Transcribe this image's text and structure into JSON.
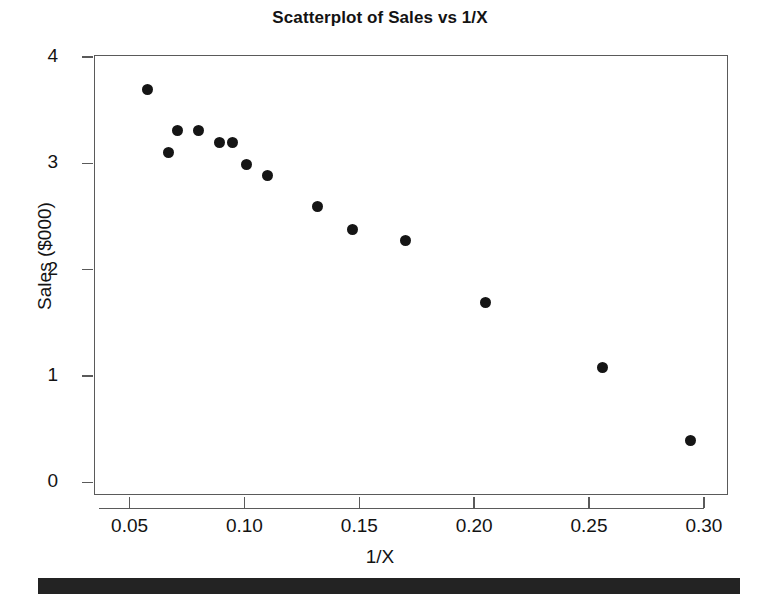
{
  "chart_data": {
    "type": "scatter",
    "title": "Scatterplot of Sales vs 1/X",
    "xlabel": "1/X",
    "ylabel": "Sales ($000)",
    "xlim": [
      0.0345,
      0.3105
    ],
    "ylim": [
      -0.12,
      4.02
    ],
    "grid": false,
    "legend": null,
    "xticks": [
      0.05,
      0.1,
      0.15,
      0.2,
      0.25,
      0.3
    ],
    "xtick_labels": [
      "0.05",
      "0.10",
      "0.15",
      "0.20",
      "0.25",
      "0.30"
    ],
    "yticks": [
      0,
      1,
      2,
      3,
      4
    ],
    "ytick_labels": [
      "0",
      "1",
      "2",
      "3",
      "4"
    ],
    "marker": "filled-circle",
    "marker_color": "#151515",
    "x": [
      0.058,
      0.067,
      0.071,
      0.08,
      0.089,
      0.095,
      0.101,
      0.11,
      0.132,
      0.147,
      0.17,
      0.205,
      0.256,
      0.294
    ],
    "y": [
      3.7,
      3.1,
      3.31,
      3.31,
      3.2,
      3.2,
      2.99,
      2.89,
      2.59,
      2.38,
      2.27,
      1.69,
      1.08,
      0.39
    ],
    "points": [
      {
        "x": 0.058,
        "y": 3.7
      },
      {
        "x": 0.067,
        "y": 3.1
      },
      {
        "x": 0.071,
        "y": 3.31
      },
      {
        "x": 0.08,
        "y": 3.31
      },
      {
        "x": 0.089,
        "y": 3.2
      },
      {
        "x": 0.095,
        "y": 3.2
      },
      {
        "x": 0.101,
        "y": 2.99
      },
      {
        "x": 0.11,
        "y": 2.89
      },
      {
        "x": 0.132,
        "y": 2.59
      },
      {
        "x": 0.147,
        "y": 2.38
      },
      {
        "x": 0.17,
        "y": 2.27
      },
      {
        "x": 0.205,
        "y": 1.69
      },
      {
        "x": 0.256,
        "y": 1.08
      },
      {
        "x": 0.294,
        "y": 0.39
      }
    ]
  },
  "figure": {
    "background_color": "#ffffff",
    "axis_color": "#5a5a5a",
    "text_color": "#131313",
    "footer_bar_color": "#232323"
  }
}
